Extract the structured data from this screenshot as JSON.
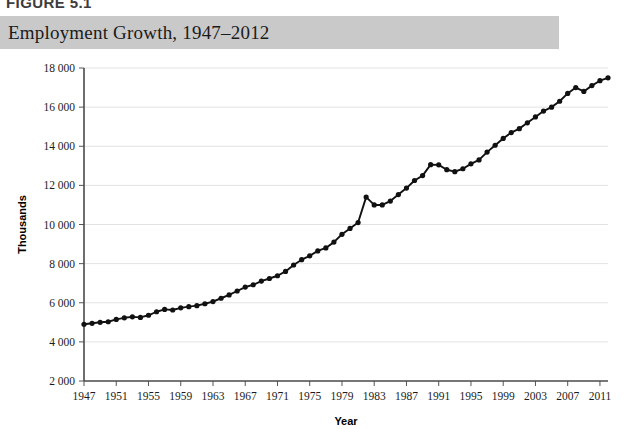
{
  "figure": {
    "number_label": "FIGURE 5.1",
    "title": "Employment Growth, 1947–2012",
    "header_bg": "#c9c9c9"
  },
  "chart_data": {
    "type": "line",
    "title": "Employment Growth, 1947–2012",
    "xlabel": "Year",
    "ylabel": "Thousands",
    "xlim": [
      1947,
      2012
    ],
    "ylim": [
      2000,
      18000
    ],
    "grid": true,
    "legend": "none",
    "line_color": "#111111",
    "marker": "circle",
    "y_ticks": [
      "2 000",
      "4 000",
      "6 000",
      "8 000",
      "10 000",
      "12 000",
      "14 000",
      "16 000",
      "18 000"
    ],
    "y_tick_values": [
      2000,
      4000,
      6000,
      8000,
      10000,
      12000,
      14000,
      16000,
      18000
    ],
    "x_ticks": [
      "1947",
      "1951",
      "1955",
      "1959",
      "1963",
      "1967",
      "1971",
      "1975",
      "1979",
      "1983",
      "1987",
      "1991",
      "1995",
      "1999",
      "2003",
      "2007",
      "2011"
    ],
    "x_tick_values": [
      1947,
      1951,
      1955,
      1959,
      1963,
      1967,
      1971,
      1975,
      1979,
      1983,
      1987,
      1991,
      1995,
      1999,
      2003,
      2007,
      2011
    ],
    "series": [
      {
        "name": "Employment",
        "x": [
          1947,
          1948,
          1949,
          1950,
          1951,
          1952,
          1953,
          1954,
          1955,
          1956,
          1957,
          1958,
          1959,
          1960,
          1961,
          1962,
          1963,
          1964,
          1965,
          1966,
          1967,
          1968,
          1969,
          1970,
          1971,
          1972,
          1973,
          1974,
          1975,
          1976,
          1977,
          1978,
          1979,
          1980,
          1981,
          1982,
          1983,
          1984,
          1985,
          1986,
          1987,
          1988,
          1989,
          1990,
          1991,
          1992,
          1993,
          1994,
          1995,
          1996,
          1997,
          1998,
          1999,
          2000,
          2001,
          2002,
          2003,
          2004,
          2005,
          2006,
          2007,
          2008,
          2009,
          2010,
          2011,
          2012
        ],
        "values": [
          4900,
          4950,
          5000,
          5030,
          5150,
          5230,
          5280,
          5250,
          5360,
          5540,
          5660,
          5630,
          5740,
          5800,
          5850,
          5950,
          6060,
          6230,
          6400,
          6600,
          6800,
          6920,
          7110,
          7240,
          7380,
          7600,
          7930,
          8200,
          8400,
          8650,
          8800,
          9100,
          9500,
          9800,
          10100,
          11400,
          11000,
          11000,
          11200,
          11530,
          11860,
          12250,
          12500,
          13060,
          13050,
          12800,
          12700,
          12850,
          13100,
          13300,
          13700,
          14050,
          14400,
          14700,
          14900,
          15200,
          15500,
          15800,
          16000,
          16300,
          16700,
          17000,
          16800,
          17100,
          17350,
          17500
        ]
      }
    ],
    "notable_points": {
      "first": {
        "year": 1947,
        "value": 4900
      },
      "last": {
        "year": 2012,
        "value": 17500
      },
      "recession_dip_1983": {
        "year": 1983,
        "value": 11000
      },
      "recession_dip_1993": {
        "year": 1993,
        "value": 12700
      },
      "recession_dip_2009": {
        "year": 2009,
        "value": 16800
      }
    }
  }
}
